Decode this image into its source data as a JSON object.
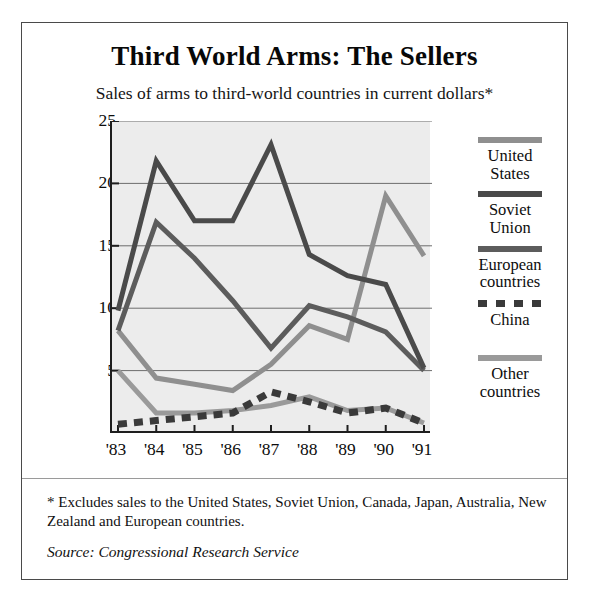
{
  "title": "Third World Arms: The Sellers",
  "subtitle": "Sales of arms to third-world countries in current dollars*",
  "footnote": "* Excludes sales to the United States, Soviet Union, Canada, Japan, Australia, New Zealand and European countries.",
  "source": "Source: Congressional Research Service",
  "legend": [
    {
      "label_line1": "United",
      "label_line2": "States",
      "color": "#8f8f8f",
      "style": "solid"
    },
    {
      "label_line1": "Soviet",
      "label_line2": "Union",
      "color": "#4a4a4a",
      "style": "solid"
    },
    {
      "label_line1": "European",
      "label_line2": "countries",
      "color": "#5c5c5c",
      "style": "solid"
    },
    {
      "label_line1": "China",
      "label_line2": "",
      "color": "#3a3a3a",
      "style": "dashed"
    },
    {
      "label_line1": "Other",
      "label_line2": "countries",
      "color": "#9a9a9a",
      "style": "solid"
    }
  ],
  "chart_data": {
    "type": "line",
    "title": "Third World Arms: The Sellers",
    "subtitle": "Sales of arms to third-world countries in current dollars*",
    "xlabel": "",
    "ylabel": "Billions of Dollars",
    "categories": [
      "'83",
      "'84",
      "'85",
      "'86",
      "'87",
      "'88",
      "'89",
      "'90",
      "'91"
    ],
    "yticks": [
      5,
      10,
      15,
      20,
      25
    ],
    "ylim": [
      0,
      25
    ],
    "grid": true,
    "legend_position": "right",
    "series": [
      {
        "name": "United States",
        "color": "#8f8f8f",
        "style": "solid",
        "values": [
          8.2,
          4.4,
          3.9,
          3.4,
          5.5,
          8.6,
          7.5,
          19.0,
          14.2
        ]
      },
      {
        "name": "Soviet Union",
        "color": "#4a4a4a",
        "style": "solid",
        "values": [
          9.8,
          21.8,
          17.0,
          17.0,
          23.1,
          14.3,
          12.6,
          11.9,
          5.2
        ]
      },
      {
        "name": "European countries",
        "color": "#5c5c5c",
        "style": "solid",
        "values": [
          8.2,
          16.9,
          14.0,
          10.6,
          6.8,
          10.2,
          9.3,
          8.1,
          5.0
        ]
      },
      {
        "name": "China",
        "color": "#3a3a3a",
        "style": "dashed",
        "values": [
          0.7,
          1.0,
          1.3,
          1.6,
          3.3,
          2.5,
          1.6,
          2.0,
          0.8
        ]
      },
      {
        "name": "Other countries",
        "color": "#9a9a9a",
        "style": "solid",
        "values": [
          5.0,
          1.6,
          1.6,
          1.8,
          2.2,
          2.9,
          1.8,
          2.0,
          0.8
        ]
      }
    ]
  }
}
